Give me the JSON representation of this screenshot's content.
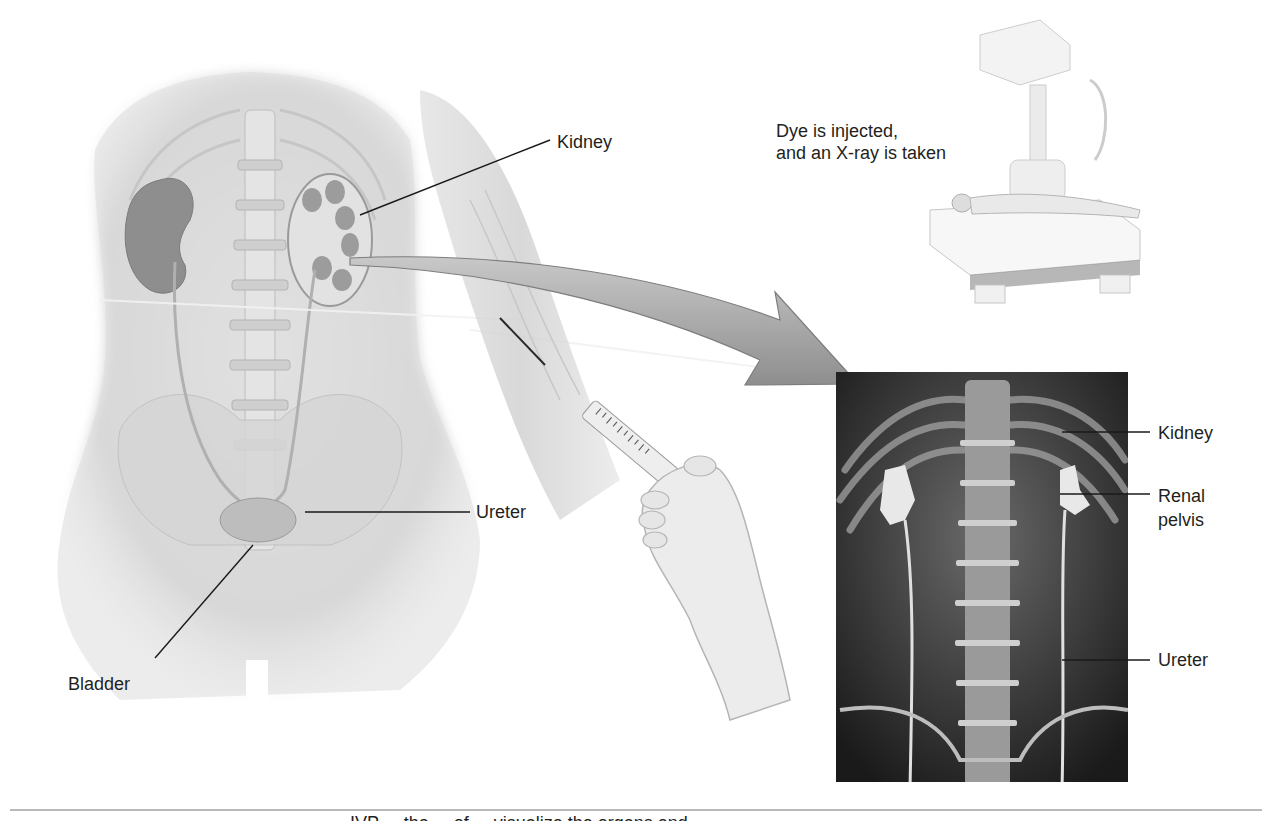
{
  "figure": {
    "instruction": {
      "line1": "Dye is injected,",
      "line2": "and an X-ray is taken"
    },
    "body_labels": {
      "kidney": "Kidney",
      "ureter": "Ureter",
      "bladder": "Bladder"
    },
    "xray_labels": {
      "kidney": "Kidney",
      "renal_pelvis_line1": "Renal",
      "renal_pelvis_line2": "pelvis",
      "ureter": "Ureter"
    },
    "caption_partial": "... IVP ... the ... of ... visualize the organs and"
  },
  "colors": {
    "background": "#ffffff",
    "text": "#231f20",
    "leader_line": "#1a1a1a",
    "body_tone": "#d8d8d8",
    "organ_tone": "#8c8c8c",
    "arrow_tone": "#a8a8a8",
    "xray_dark": "#1c1c1c",
    "xray_bright": "#e6e6e6",
    "rule": "#b9b9b9"
  }
}
